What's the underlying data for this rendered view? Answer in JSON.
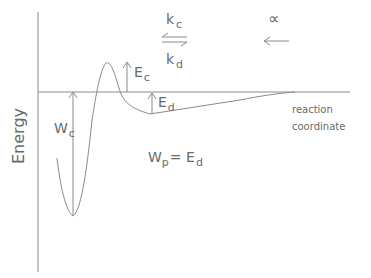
{
  "diagram": {
    "type": "potential-energy-curve",
    "axes": {
      "y_label": "Energy",
      "x_label_line1": "reaction",
      "x_label_line2": "coordinate"
    },
    "rates": {
      "forward": "k",
      "forward_sub": "c",
      "backward": "k",
      "backward_sub": "d",
      "alpha_symbol": "∝",
      "arrow_left": "←"
    },
    "annotations": {
      "Ec": {
        "main": "E",
        "sub": "c"
      },
      "Ed": {
        "main": "E",
        "sub": "d"
      },
      "Wc": {
        "main": "W",
        "sub": "c"
      },
      "equation": {
        "lhs": "W",
        "lhs_sub": "p",
        "eq": "= ",
        "rhs": "E",
        "rhs_sub": "d"
      }
    },
    "colors": {
      "line": "#8a8a8a",
      "text": "#6a6a6a",
      "background": "#ffffff"
    }
  }
}
